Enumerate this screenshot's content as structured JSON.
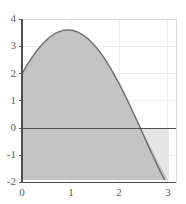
{
  "chart_data": {
    "type": "area",
    "title": "",
    "xlabel": "",
    "ylabel": "",
    "xlim": [
      0,
      3.3
    ],
    "ylim": [
      -2,
      4
    ],
    "grid": true,
    "legend": null,
    "function": "y = 2*cos(x) + 3*sin(x)",
    "x_ticks": [
      0,
      1,
      2,
      3
    ],
    "x_tick_labels": [
      "0",
      "1",
      "2",
      "3"
    ],
    "y_ticks": [
      -2,
      -1,
      0,
      1,
      2,
      3,
      4
    ],
    "y_tick_labels": [
      "-2",
      "-1",
      "0",
      "1",
      "2",
      "3",
      "4"
    ],
    "series": [
      {
        "name": "curve",
        "x": [
          0,
          0.1,
          0.2,
          0.3,
          0.4,
          0.5,
          0.6,
          0.7,
          0.8,
          0.9,
          1.0,
          1.1,
          1.2,
          1.3,
          1.4,
          1.5,
          1.6,
          1.7,
          1.8,
          1.9,
          2.0,
          2.1,
          2.2,
          2.3,
          2.4,
          2.5,
          2.6,
          2.7,
          2.8,
          2.9,
          3.0,
          3.1,
          3.15
        ],
        "y": [
          2.0,
          2.29,
          2.56,
          2.8,
          3.01,
          3.19,
          3.34,
          3.46,
          3.54,
          3.59,
          3.6,
          3.58,
          3.52,
          3.42,
          3.3,
          3.13,
          2.94,
          2.72,
          2.47,
          2.19,
          1.89,
          1.57,
          1.23,
          0.88,
          0.51,
          0.14,
          -0.24,
          -0.62,
          -0.99,
          -1.36,
          -1.71,
          -2.04,
          -2.2
        ]
      }
    ],
    "fill_above_axis_color": "#c4c4c4",
    "fill_below_axis_color": "#e8e8e8",
    "curve_color": "#707070",
    "axis_color": "#555555",
    "grid_color": "#ececec",
    "zero_crossing_x": 2.55,
    "peak": {
      "x": 0.98,
      "y": 3.61
    },
    "start_point": {
      "x": 0,
      "y": 2.0
    },
    "end_point": {
      "x": 3.15,
      "y": -2.2
    }
  }
}
